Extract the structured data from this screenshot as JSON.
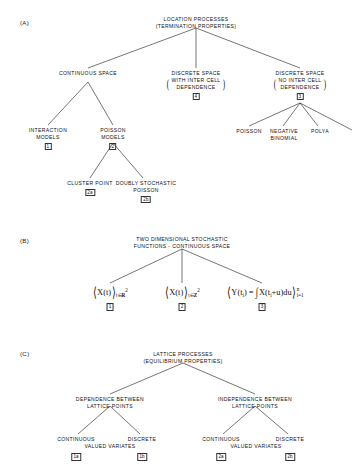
{
  "figure": {
    "sections": [
      {
        "tag": "(A)",
        "root": {
          "lines": [
            "LOCATION PROCESSES",
            "(TERMINATION PROPERTIES)"
          ]
        },
        "nodes": {
          "continuous_space": {
            "lines": [
              "CONTINUOUS SPACE"
            ]
          },
          "discrete_space_inter": {
            "lines": [
              "DISCRETE SPACE"
            ],
            "paren_lines": [
              "WITH INTER CELL",
              "DEPENDENCE"
            ],
            "index": "4"
          },
          "discrete_space_nointer": {
            "lines": [
              "DISCRETE SPACE"
            ],
            "paren_lines": [
              "NO INTER CELL",
              "DEPENDENCE"
            ],
            "index": "3"
          },
          "interaction_models": {
            "lines": [
              "INTERACTION",
              "MODELS"
            ],
            "index": "1"
          },
          "poisson_models": {
            "lines": [
              "POISSON",
              "MODELS"
            ],
            "index": "2"
          },
          "cluster_point": {
            "lines": [
              "CLUSTER POINT"
            ],
            "index": "2a"
          },
          "doubly_stochastic_poisson": {
            "lines": [
              "DOUBLY STOCHASTIC",
              "POISSON"
            ],
            "index": "2b"
          },
          "poisson": {
            "lines": [
              "POISSON"
            ]
          },
          "negative_binomial": {
            "lines": [
              "NEGATIVE",
              "BINOMIAL"
            ]
          },
          "polya": {
            "lines": [
              "POLYA"
            ]
          }
        }
      },
      {
        "tag": "(B)",
        "root": {
          "lines": [
            "TWO DIMENSIONAL STOCHASTIC",
            "FUNCTIONS - CONTINUOUS SPACE"
          ]
        },
        "formulas": [
          {
            "id": "b1",
            "text": "⟨X(t)⟩ t∈R²",
            "index": "1"
          },
          {
            "id": "b2",
            "text": "⟨X(t)⟩ t∈Z²",
            "index": "2"
          },
          {
            "id": "b3",
            "text": "⟨Y(t_i) = ∫X(t_i+u)du⟩ i=1..n",
            "index": "3"
          }
        ],
        "symbols": {
          "X": "X",
          "Y": "Y",
          "t": "t",
          "u": "u",
          "in": "∈",
          "reals": "R",
          "integers": "Z",
          "exp2": "2",
          "integral": "∫",
          "d": "d",
          "eq": "=",
          "plus": "+",
          "sub_i": "i",
          "sup_n": "n",
          "idx_low": "i=1",
          "angle_open": "⟨",
          "angle_close": "⟩"
        }
      },
      {
        "tag": "(C)",
        "root": {
          "lines": [
            "LATTICE PROCESSES",
            "(EQUILIBRIUM PROPERTIES)"
          ]
        },
        "nodes": {
          "dependence": {
            "lines": [
              "DEPENDENCE  BETWEEN",
              "LATTICE POINTS"
            ]
          },
          "independence": {
            "lines": [
              "INDEPENDENCE  BETWEEN",
              "LATTICE POINTS"
            ]
          },
          "left_continuous": {
            "lines": [
              "CONTINUOUS"
            ],
            "index": "1a"
          },
          "left_discrete": {
            "lines": [
              "DISCRETE"
            ],
            "index": "1b"
          },
          "left_valued_variates": {
            "lines": [
              "VALUED  VARIATES"
            ]
          },
          "right_continuous": {
            "lines": [
              "CONTINUOUS"
            ],
            "index": "2a"
          },
          "right_discrete": {
            "lines": [
              "DISCRETE"
            ],
            "index": "2b"
          },
          "right_valued_variates": {
            "lines": [
              "VALUED VARIATES"
            ]
          }
        }
      }
    ]
  },
  "colors": {
    "ink": "#111111",
    "paper": "#ffffff",
    "line": "#1a1a1a"
  }
}
